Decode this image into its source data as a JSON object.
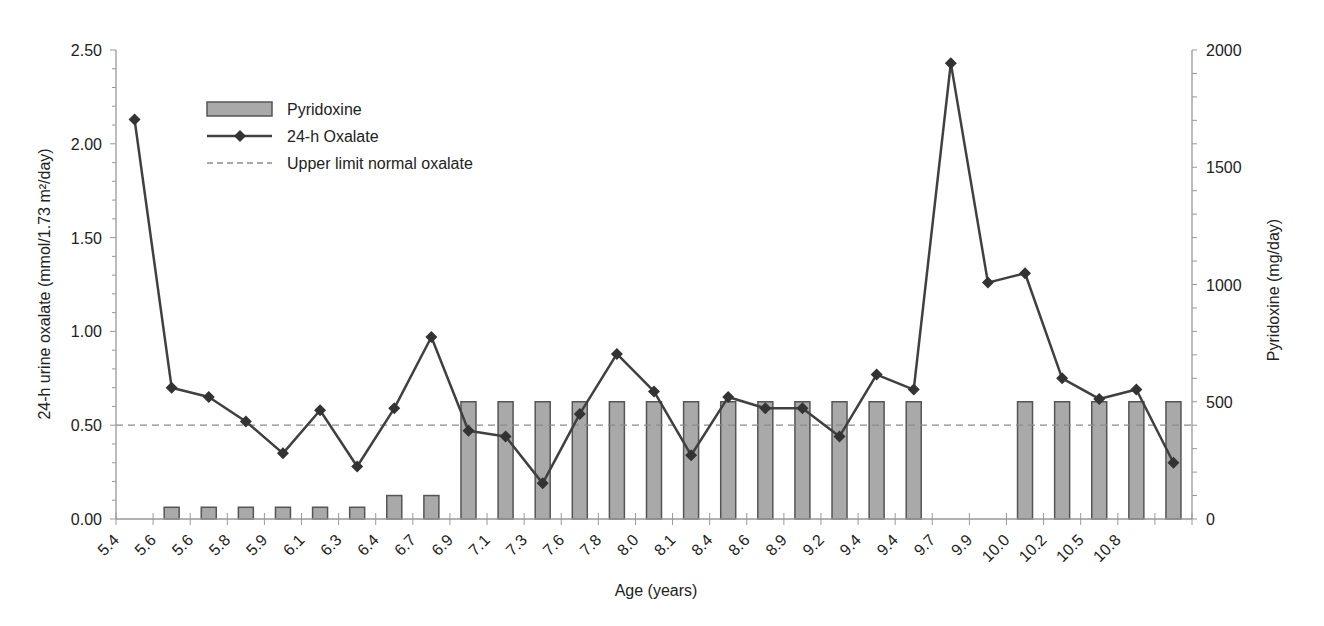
{
  "chart_data": {
    "type": "bar+line",
    "title": "",
    "xlabel": "Age (years)",
    "ylabel": "24-h urine oxalate (mmol/1.73 m²/day)",
    "ylabel_right": "Pyridoxine (mg/day)",
    "ylim": [
      0,
      2.5
    ],
    "ylim_right": [
      0,
      2000
    ],
    "yticks": [
      "0.00",
      "0.50",
      "1.00",
      "1.50",
      "2.00",
      "2.50"
    ],
    "yticks_right": [
      "0",
      "500",
      "1000",
      "1500",
      "2000"
    ],
    "categories": [
      "5.4",
      "5.6",
      "5.6",
      "5.8",
      "5.9",
      "6.1",
      "6.3",
      "6.4",
      "6.7",
      "6.9",
      "7.1",
      "7.3",
      "7.6",
      "7.8",
      "8.0",
      "8.1",
      "8.4",
      "8.6",
      "8.9",
      "9.2",
      "9.4",
      "9.4",
      "9.7",
      "9.9",
      "10.0",
      "10.2",
      "10.5",
      "10.8",
      "11.5"
    ],
    "grid": false,
    "legend_position": "upper-left",
    "series": [
      {
        "name": "Pyridoxine",
        "type": "bar",
        "axis": "right",
        "color": "#a9a9a9",
        "values": [
          0,
          50,
          50,
          50,
          50,
          50,
          50,
          100,
          100,
          500,
          500,
          500,
          500,
          500,
          500,
          500,
          500,
          500,
          500,
          500,
          500,
          500,
          0,
          0,
          500,
          500,
          500,
          500,
          500
        ]
      },
      {
        "name": "24-h Oxalate",
        "type": "line",
        "axis": "left",
        "marker": "diamond",
        "color": "#404040",
        "values": [
          2.13,
          0.7,
          0.65,
          0.52,
          0.35,
          0.58,
          0.28,
          0.59,
          0.97,
          0.47,
          0.44,
          0.19,
          0.56,
          0.88,
          0.68,
          0.34,
          0.65,
          0.59,
          0.59,
          0.44,
          0.77,
          0.69,
          2.43,
          1.26,
          1.31,
          0.75,
          0.64,
          0.69,
          0.3
        ]
      },
      {
        "name": "Upper limit normal oxalate",
        "type": "reference-line",
        "axis": "left",
        "style": "dashed",
        "color": "#8c8c8c",
        "value": 0.5
      }
    ]
  },
  "legend": {
    "items": [
      {
        "label": "Pyridoxine"
      },
      {
        "label": "24-h Oxalate"
      },
      {
        "label": "Upper limit normal oxalate"
      }
    ]
  },
  "axes": {
    "x_title": "Age (years)",
    "y_left_title": "24-h urine oxalate (mmol/1.73 m²/day)",
    "y_right_title": "Pyridoxine (mg/day)"
  }
}
